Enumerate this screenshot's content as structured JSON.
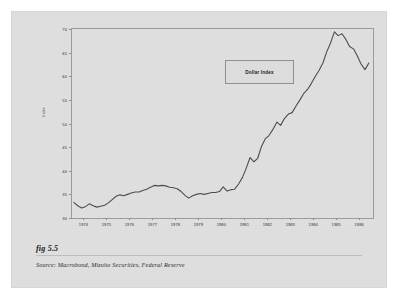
{
  "figure": {
    "label": "fig 5.5",
    "source": "Source:  Macrobond, Mizuho Securities, Federal Reserve"
  },
  "chart_data": {
    "type": "line",
    "title": "",
    "legend": [
      "Dollar Index"
    ],
    "legend_position": "inside-top-center",
    "grid": false,
    "xlabel": "",
    "ylabel": "Index",
    "ylim": [
      30,
      70
    ],
    "yticks": [
      30,
      35,
      40,
      45,
      50,
      55,
      60,
      65,
      70
    ],
    "xlim": [
      1973.5,
      1986.6
    ],
    "xticks": [
      1974,
      1975,
      1976,
      1977,
      1978,
      1979,
      1980,
      1981,
      1982,
      1983,
      1984,
      1985,
      1986
    ],
    "xtick_labels": [
      "1974",
      "1975",
      "1976",
      "1977",
      "1978",
      "1979",
      "1980",
      "1981",
      "1982",
      "1983",
      "1984",
      "1985",
      "1986"
    ],
    "series": [
      {
        "name": "Dollar Index",
        "color": "#4d4d4d",
        "x": [
          1973.58,
          1973.75,
          1973.92,
          1974.08,
          1974.25,
          1974.42,
          1974.58,
          1974.75,
          1974.92,
          1975.08,
          1975.25,
          1975.42,
          1975.58,
          1975.75,
          1975.92,
          1976.08,
          1976.25,
          1976.42,
          1976.58,
          1976.75,
          1976.92,
          1977.08,
          1977.25,
          1977.42,
          1977.58,
          1977.75,
          1977.92,
          1978.08,
          1978.25,
          1978.42,
          1978.58,
          1978.75,
          1978.92,
          1979.08,
          1979.25,
          1979.42,
          1979.58,
          1979.75,
          1979.92,
          1980.08,
          1980.25,
          1980.42,
          1980.58,
          1980.75,
          1980.92,
          1981.08,
          1981.25,
          1981.42,
          1981.58,
          1981.75,
          1981.92,
          1982.08,
          1982.25,
          1982.42,
          1982.58,
          1982.75,
          1982.92,
          1983.08,
          1983.25,
          1983.42,
          1983.58,
          1983.75,
          1983.92,
          1984.08,
          1984.25,
          1984.42,
          1984.58,
          1984.75,
          1984.92,
          1985.08,
          1985.25,
          1985.42,
          1985.58,
          1985.75,
          1985.92,
          1986.08,
          1986.25,
          1986.42
        ],
        "y": [
          33.3,
          32.6,
          32.1,
          32.4,
          33.0,
          32.6,
          32.3,
          32.5,
          32.7,
          33.2,
          33.9,
          34.6,
          34.9,
          34.7,
          35.0,
          35.3,
          35.5,
          35.5,
          35.8,
          36.1,
          36.5,
          36.9,
          36.8,
          36.9,
          36.8,
          36.5,
          36.4,
          36.2,
          35.6,
          34.8,
          34.2,
          34.7,
          35.0,
          35.2,
          35.0,
          35.2,
          35.4,
          35.4,
          35.6,
          36.6,
          35.7,
          36.0,
          36.1,
          37.2,
          38.6,
          40.5,
          42.8,
          41.9,
          42.6,
          45.2,
          46.8,
          47.5,
          48.8,
          50.3,
          49.6,
          51.1,
          52.0,
          52.3,
          53.7,
          55.0,
          56.3,
          57.2,
          58.5,
          59.9,
          61.2,
          62.8,
          65.1,
          67.0,
          69.4,
          68.6,
          69.0,
          67.8,
          66.3,
          65.8,
          64.3,
          62.6,
          61.4,
          62.8
        ]
      }
    ]
  }
}
